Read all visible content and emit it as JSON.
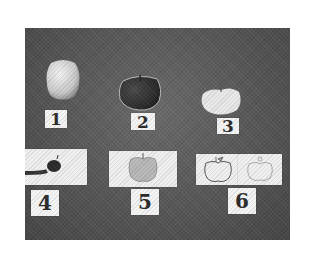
{
  "photo": {
    "description": "Black-and-white photograph of apples and picture cards with numbered labels",
    "items": [
      {
        "number": "1",
        "content": "real apple, light colored, upright"
      },
      {
        "number": "2",
        "content": "real apple, dark colored, round"
      },
      {
        "number": "3",
        "content": "apple, pale, flattened/sliced"
      },
      {
        "number": "4",
        "content": "card with dark apple silhouette on stick/stem"
      },
      {
        "number": "5",
        "content": "card with shaded apple drawing"
      },
      {
        "number": "6",
        "content": "two cards with outline apple line drawings"
      }
    ]
  }
}
